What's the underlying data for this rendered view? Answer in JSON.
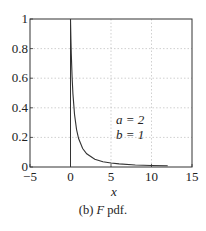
{
  "chart_data": {
    "type": "line",
    "title": "",
    "xlabel": "x",
    "ylabel": "",
    "xlim": [
      -5,
      15
    ],
    "ylim": [
      0,
      1
    ],
    "x_ticks": [
      "-5",
      "0",
      "5",
      "10",
      "15"
    ],
    "y_ticks": [
      "0",
      "0.2",
      "0.4",
      "0.6",
      "0.8",
      "1"
    ],
    "grid": true,
    "series": [
      {
        "name": "F pdf (a=2, b=1)",
        "x": [
          0,
          0.05,
          0.1,
          0.2,
          0.3,
          0.5,
          0.75,
          1,
          1.5,
          2,
          3,
          4,
          5,
          6,
          8,
          10,
          12
        ],
        "values": [
          1.0,
          0.867,
          0.761,
          0.604,
          0.494,
          0.354,
          0.253,
          0.192,
          0.125,
          0.089,
          0.053,
          0.036,
          0.027,
          0.021,
          0.014,
          0.01,
          0.008
        ]
      }
    ],
    "vertical_line": {
      "x": 0,
      "y_from": 0,
      "y_to": 1
    },
    "annotations": [
      "a = 2",
      "b = 1"
    ]
  },
  "plot": {
    "xlabel": "x",
    "annotation_a": "a = 2",
    "annotation_b": "b = 1"
  },
  "caption": {
    "prefix": "(b) ",
    "italic": "F",
    "suffix": " pdf."
  }
}
